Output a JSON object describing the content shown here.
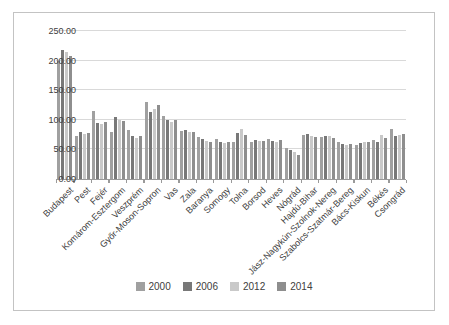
{
  "figure": {
    "background": "#ffffff",
    "border_color": "#c3c3c3",
    "gridline_color": "#d9d9d9",
    "axis_line_color": "#9a9a9a",
    "text_color": "#404040"
  },
  "chart_data": {
    "type": "bar",
    "title": "",
    "xlabel": "",
    "ylabel": "",
    "ylim": [
      0,
      250
    ],
    "yticks": [
      0,
      50,
      100,
      150,
      200,
      250
    ],
    "ytick_labels": [
      "0.00",
      "50.00",
      "100.00",
      "150.00",
      "200.00",
      "250.00"
    ],
    "grid": true,
    "legend_position": "bottom",
    "categories": [
      "Budapest",
      "Pest",
      "Fejér",
      "Komárom-Esztergom",
      "Veszprém",
      "Győr-Moson-Sopron",
      "Vas",
      "Zala",
      "Baranya",
      "Somogy",
      "Tolna",
      "Borsod",
      "Heves",
      "Nógrád",
      "Hajdú-Bihar",
      "Jász-Nagykún-Szolnok-Nereg",
      "Szabolcs-Szatmár-Bereg",
      "Bács-Kiskun",
      "Békés",
      "Csongrád"
    ],
    "series": [
      {
        "name": "2000",
        "color": "#a0a0a0",
        "values": [
          200,
          72,
          115,
          80,
          83,
          130,
          107,
          82,
          71,
          67,
          62,
          62,
          68,
          52,
          74,
          71,
          63,
          58,
          66,
          84
        ]
      },
      {
        "name": "2006",
        "color": "#787878",
        "values": [
          218,
          79,
          95,
          104,
          73,
          114,
          99,
          83,
          68,
          62,
          78,
          66,
          65,
          49,
          76,
          73,
          60,
          61,
          62,
          72
        ]
      },
      {
        "name": "2012",
        "color": "#c9c9c9",
        "values": [
          215,
          76,
          93,
          99,
          70,
          118,
          96,
          79,
          64,
          61,
          84,
          64,
          63,
          45,
          73,
          72,
          58,
          63,
          74,
          74
        ]
      },
      {
        "name": "2014",
        "color": "#8e8e8e",
        "values": [
          208,
          78,
          97,
          98,
          72,
          125,
          100,
          80,
          62,
          62,
          74,
          65,
          66,
          40,
          71,
          70,
          60,
          62,
          70,
          76
        ]
      }
    ]
  }
}
